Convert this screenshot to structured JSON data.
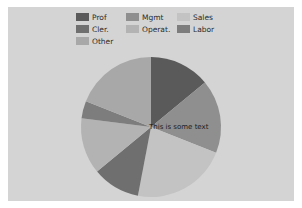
{
  "figure": {
    "background_color": "#ffffff",
    "plot_background_color": "#d4d4d4"
  },
  "legend": {
    "entries": [
      {
        "label": "Prof",
        "color": "#5a5a5a"
      },
      {
        "label": "Mgmt",
        "color": "#8f8f8f"
      },
      {
        "label": "Sales",
        "color": "#c3c3c3"
      },
      {
        "label": "Cler.",
        "color": "#6f6f6f"
      },
      {
        "label": "Operat.",
        "color": "#b3b3b3"
      },
      {
        "label": "Labor",
        "color": "#7d7d7d"
      },
      {
        "label": "Other",
        "color": "#a8a8a8"
      }
    ]
  },
  "annotation": {
    "center_text": "This is some text"
  },
  "chart_data": {
    "type": "pie",
    "title": "",
    "xlabel": "",
    "ylabel": "",
    "grid": false,
    "legend_position": "upper center",
    "start_angle_deg": 90,
    "direction": "clockwise",
    "center_px": [
      151,
      127
    ],
    "radius_px": 70,
    "categories": [
      "Prof",
      "Mgmt",
      "Sales",
      "Cler.",
      "Operat.",
      "Labor",
      "Other"
    ],
    "values": [
      14,
      17,
      22,
      11,
      13,
      4,
      19
    ],
    "colors": [
      "#5a5a5a",
      "#8f8f8f",
      "#c3c3c3",
      "#6f6f6f",
      "#b3b3b3",
      "#7d7d7d",
      "#a8a8a8"
    ],
    "slices": [
      {
        "label": "Prof",
        "value": 14,
        "color": "#5a5a5a",
        "start_angle_deg": 90,
        "end_angle_deg": 39.6
      },
      {
        "label": "Mgmt",
        "value": 17,
        "color": "#8f8f8f",
        "start_angle_deg": 39.6,
        "end_angle_deg": -21.6
      },
      {
        "label": "Sales",
        "value": 22,
        "color": "#c3c3c3",
        "start_angle_deg": -21.6,
        "end_angle_deg": -100.8
      },
      {
        "label": "Cler.",
        "value": 11,
        "color": "#6f6f6f",
        "start_angle_deg": -100.8,
        "end_angle_deg": -140.4
      },
      {
        "label": "Operat.",
        "value": 13,
        "color": "#b3b3b3",
        "start_angle_deg": -140.4,
        "end_angle_deg": -187.2
      },
      {
        "label": "Labor",
        "value": 4,
        "color": "#7d7d7d",
        "start_angle_deg": -187.2,
        "end_angle_deg": -201.6
      },
      {
        "label": "Other",
        "value": 19,
        "color": "#a8a8a8",
        "start_angle_deg": -201.6,
        "end_angle_deg": -270
      }
    ]
  }
}
